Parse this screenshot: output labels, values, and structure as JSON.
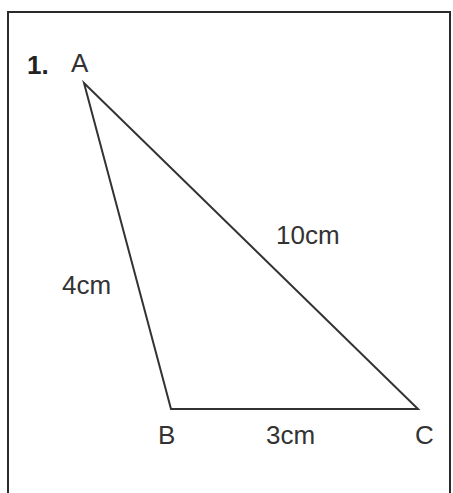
{
  "question": {
    "number": "1."
  },
  "triangle": {
    "vertices": [
      {
        "name": "A",
        "x": 84,
        "y": 83
      },
      {
        "name": "B",
        "x": 171,
        "y": 409
      },
      {
        "name": "C",
        "x": 418,
        "y": 409
      }
    ],
    "sides": [
      {
        "id": "AB",
        "label": "4cm"
      },
      {
        "id": "BC",
        "label": "3cm"
      },
      {
        "id": "AC",
        "label": "10cm"
      }
    ],
    "line_color": "#333333"
  }
}
